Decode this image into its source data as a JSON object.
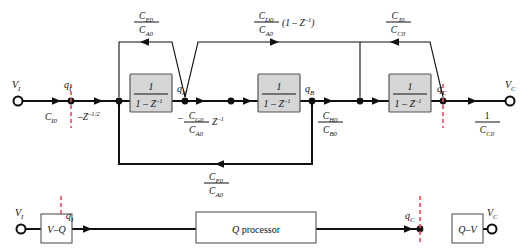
{
  "diagram": {
    "colors": {
      "wire": "#111111",
      "block_fill": "#d6d6d6",
      "block_stroke": "#555555",
      "dashed_marker": "#e84a5f",
      "background": "#ffffff"
    },
    "terminals": {
      "input_top_label": "V",
      "input_top_sub": "I",
      "output_top_label": "V",
      "output_top_sub": "C",
      "input_bottom_label": "V",
      "input_bottom_sub": "I",
      "output_bottom_label": "V",
      "output_bottom_sub": "C"
    },
    "nodes": {
      "qI": "q",
      "qI_sub": "I",
      "qA": "q",
      "qA_sub": "A",
      "qB": "q",
      "qB_sub": "B",
      "qC": "q",
      "qC_sub": "C",
      "qI_bottom": "q",
      "qI_bottom_sub": "I",
      "qC_bottom": "q",
      "qC_bottom_sub": "C"
    },
    "blocks": [
      {
        "name": "integrator-1",
        "numerator": "1",
        "denominator": "1 – Z",
        "den_sup": "–1"
      },
      {
        "name": "integrator-2",
        "numerator": "1",
        "denominator": "1 – Z",
        "den_sup": "–1"
      },
      {
        "name": "integrator-3",
        "numerator": "1",
        "denominator": "1 – Z",
        "den_sup": "–1"
      }
    ],
    "bottom_blocks": {
      "v_to_q": "V–Q",
      "processor_italic": "Q",
      "processor_rest": " processor",
      "q_to_v": "Q–V"
    },
    "gains": {
      "input_gain": {
        "name": "C-I0",
        "text": "C",
        "sub": "I0"
      },
      "delay_gain": {
        "name": "neg-half-delay",
        "text": "–Z",
        "sup": "–1/2"
      },
      "g_gain": {
        "name": "C-G0-over-C-A0-z",
        "sign": "–",
        "num": "C",
        "num_sub": "G0",
        "den": "C",
        "den_sub": "A0",
        "suffix": "Z",
        "suffix_sup": "–1"
      },
      "h_gain": {
        "name": "C-H0-over-C-B0",
        "num": "C",
        "num_sub": "H0",
        "den": "C",
        "den_sub": "B0"
      },
      "output_gain": {
        "name": "one-over-C-C0",
        "num": "1",
        "den": "C",
        "den_sub": "C0"
      }
    },
    "feedback_paths": [
      {
        "name": "feedback-E",
        "num": "C",
        "num_sub": "E0",
        "den": "C",
        "den_sub": "A0",
        "suffix": "",
        "direction": "left"
      },
      {
        "name": "feedforward-D",
        "num": "C",
        "num_sub": "D0",
        "den": "C",
        "den_sub": "A0",
        "suffix": "(1 – Z",
        "suffix_sup": "–1",
        "suffix_tail": ")",
        "direction": "right"
      },
      {
        "name": "feedback-J",
        "num": "C",
        "num_sub": "J0",
        "den": "C",
        "den_sub": "C0",
        "suffix": "",
        "direction": "left"
      },
      {
        "name": "feedback-F",
        "num": "C",
        "num_sub": "F0",
        "den": "C",
        "den_sub": "A0",
        "suffix": "",
        "direction": "left"
      }
    ]
  }
}
